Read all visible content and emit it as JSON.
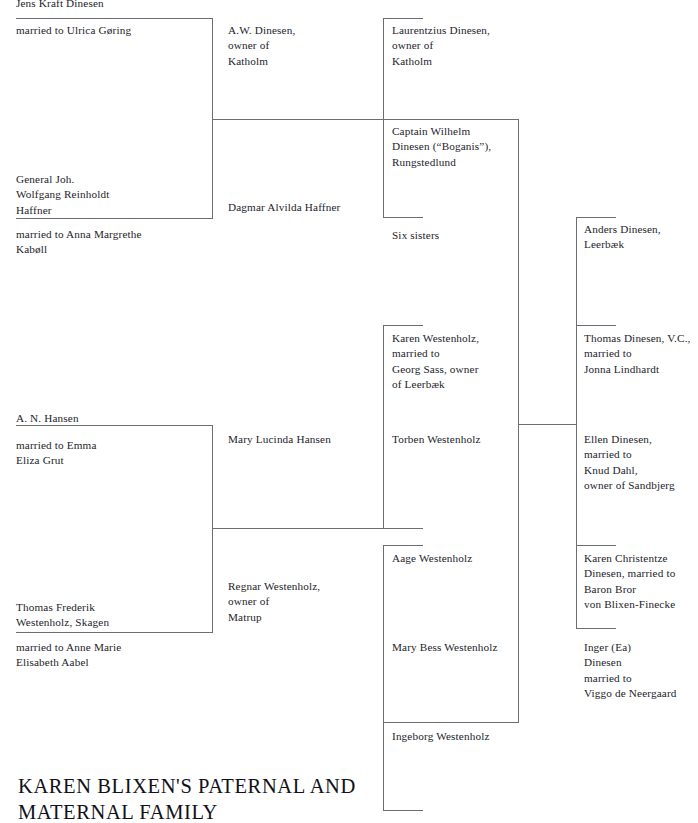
{
  "title": "KAREN BLIXEN'S PATERNAL AND\nMATERNAL FAMILY",
  "colors": {
    "rule": "#6d6d75",
    "text": "#23232b",
    "background": "#ffffff"
  },
  "nodes": [
    {
      "id": "jens-kraft-dinesen",
      "text": "Jens Kraft Dinesen",
      "x": 16,
      "y": -4,
      "w": 200
    },
    {
      "id": "married-ulrica-goring",
      "text": "married to Ulrica Gøring",
      "x": 16,
      "y": 23,
      "w": 200
    },
    {
      "id": "general-haffner",
      "text": "General Joh.\nWolfgang Reinholdt\nHaffner",
      "x": 16,
      "y": 172,
      "w": 200
    },
    {
      "id": "married-anna-margrethe",
      "text": "married to Anna Margrethe\nKabøll",
      "x": 16,
      "y": 227,
      "w": 200
    },
    {
      "id": "a-n-hansen",
      "text": "A. N. Hansen",
      "x": 16,
      "y": 411,
      "w": 200
    },
    {
      "id": "married-emma-eliza-grut",
      "text": "married to Emma\nEliza Grut",
      "x": 16,
      "y": 438,
      "w": 200
    },
    {
      "id": "thomas-frederik-westenholz",
      "text": "Thomas Frederik\nWestenholz, Skagen",
      "x": 16,
      "y": 600,
      "w": 200
    },
    {
      "id": "married-anne-marie-aabel",
      "text": "married to Anne Marie\nElisabeth Aabel",
      "x": 16,
      "y": 640,
      "w": 200
    },
    {
      "id": "aw-dinesen",
      "text": "A.W. Dinesen,\nowner of\nKatholm",
      "x": 228,
      "y": 23,
      "w": 150
    },
    {
      "id": "dagmar-alvilda-haffner",
      "text": "Dagmar Alvilda Haffner",
      "x": 228,
      "y": 200,
      "w": 160
    },
    {
      "id": "mary-lucinda-hansen",
      "text": "Mary Lucinda Hansen",
      "x": 228,
      "y": 432,
      "w": 160
    },
    {
      "id": "regnar-westenholz",
      "text": "Regnar Westenholz,\nowner of\nMatrup",
      "x": 228,
      "y": 579,
      "w": 160
    },
    {
      "id": "laurentzius-dinesen",
      "text": "Laurentzius Dinesen,\nowner of\nKatholm",
      "x": 392,
      "y": 23,
      "w": 140
    },
    {
      "id": "captain-wilhelm-dinesen",
      "text": "Captain Wilhelm\nDinesen (“Boganis”),\nRungstedlund",
      "x": 392,
      "y": 124,
      "w": 150
    },
    {
      "id": "six-sisters",
      "text": "Six sisters",
      "x": 392,
      "y": 228,
      "w": 140
    },
    {
      "id": "karen-westenholz",
      "text": "Karen Westenholz,\nmarried to\nGeorg Sass, owner\nof Leerbæk",
      "x": 392,
      "y": 331,
      "w": 150
    },
    {
      "id": "torben-westenholz",
      "text": "Torben Westenholz",
      "x": 392,
      "y": 432,
      "w": 150
    },
    {
      "id": "aage-westenholz",
      "text": "Aage Westenholz",
      "x": 392,
      "y": 551,
      "w": 150
    },
    {
      "id": "mary-bess-westenholz",
      "text": "Mary Bess Westenholz",
      "x": 392,
      "y": 640,
      "w": 160
    },
    {
      "id": "ingeborg-westenholz",
      "text": "Ingeborg Westenholz",
      "x": 392,
      "y": 729,
      "w": 160
    },
    {
      "id": "anders-dinesen",
      "text": "Anders Dinesen,\nLeerbæk",
      "x": 584,
      "y": 222,
      "w": 115
    },
    {
      "id": "thomas-dinesen-vc",
      "text": "Thomas Dinesen, V.C.,\nmarried to\nJonna Lindhardt",
      "x": 584,
      "y": 331,
      "w": 120
    },
    {
      "id": "ellen-dinesen",
      "text": "Ellen Dinesen,\nmarried to\nKnud Dahl,\nowner of Sandbjerg",
      "x": 584,
      "y": 432,
      "w": 120
    },
    {
      "id": "karen-christentze-dinesen",
      "text": "Karen Christentze\nDinesen, married to\nBaron Bror\nvon Blixen-Finecke",
      "x": 584,
      "y": 551,
      "w": 120
    },
    {
      "id": "inger-ea-dinesen",
      "text": "Inger (Ea)\nDinesen\nmarried to\nViggo de Neergaard",
      "x": 584,
      "y": 640,
      "w": 120
    }
  ],
  "rules": [
    {
      "id": "col1-top-bracket-top",
      "o": "h",
      "x": 16,
      "y": 18,
      "len": 197
    },
    {
      "id": "col1-top-bracket-side",
      "o": "v",
      "x": 212,
      "y": 18,
      "len": 201
    },
    {
      "id": "col1-top-bracket-bottom",
      "o": "h",
      "x": 16,
      "y": 218,
      "len": 197
    },
    {
      "id": "col1-top-connector",
      "o": "h",
      "x": 212,
      "y": 119,
      "len": 172
    },
    {
      "id": "col1-bot-bracket-top",
      "o": "h",
      "x": 16,
      "y": 425,
      "len": 197
    },
    {
      "id": "col1-bot-bracket-side",
      "o": "v",
      "x": 212,
      "y": 425,
      "len": 208
    },
    {
      "id": "col1-bot-bracket-bottom",
      "o": "h",
      "x": 16,
      "y": 632,
      "len": 197
    },
    {
      "id": "col1-bot-connector",
      "o": "h",
      "x": 212,
      "y": 528,
      "len": 172
    },
    {
      "id": "col3-top-bracket-top",
      "o": "h",
      "x": 383,
      "y": 18,
      "len": 40
    },
    {
      "id": "col3-top-bracket-side",
      "o": "v",
      "x": 383,
      "y": 18,
      "len": 200
    },
    {
      "id": "col3-top-bracket-bottom",
      "o": "h",
      "x": 383,
      "y": 217,
      "len": 40
    },
    {
      "id": "col3-wilhelm-bracket-top",
      "o": "h",
      "x": 383,
      "y": 119,
      "len": 135
    },
    {
      "id": "col3-wilhelm-side",
      "o": "v",
      "x": 518,
      "y": 119,
      "len": 305
    },
    {
      "id": "col3-karen-bracket-top",
      "o": "h",
      "x": 383,
      "y": 325,
      "len": 40
    },
    {
      "id": "col3-karen-side",
      "o": "v",
      "x": 383,
      "y": 325,
      "len": 204
    },
    {
      "id": "col3-karen-bracket-bot",
      "o": "h",
      "x": 383,
      "y": 528,
      "len": 40
    },
    {
      "id": "col3-karen-connector",
      "o": "h",
      "x": 212,
      "y": 528,
      "len": 0
    },
    {
      "id": "col3-aage-bracket-top",
      "o": "h",
      "x": 383,
      "y": 545,
      "len": 40
    },
    {
      "id": "col3-aage-side",
      "o": "v",
      "x": 383,
      "y": 545,
      "len": 178
    },
    {
      "id": "col3-aage-bracket-bot",
      "o": "h",
      "x": 383,
      "y": 722,
      "len": 40
    },
    {
      "id": "col3-ingeborg-side",
      "o": "v",
      "x": 383,
      "y": 722,
      "len": 88
    },
    {
      "id": "col3-ingeborg-bot",
      "o": "h",
      "x": 383,
      "y": 810,
      "len": 40
    },
    {
      "id": "col3-lower-side",
      "o": "v",
      "x": 518,
      "y": 424,
      "len": 299
    },
    {
      "id": "col3-lower-bracket-bot",
      "o": "h",
      "x": 383,
      "y": 722,
      "len": 136
    },
    {
      "id": "col5-anders-bracket-top",
      "o": "h",
      "x": 576,
      "y": 217,
      "len": 40
    },
    {
      "id": "col5-anders-side",
      "o": "v",
      "x": 576,
      "y": 217,
      "len": 108
    },
    {
      "id": "col5-thomas-bracket-top",
      "o": "h",
      "x": 576,
      "y": 325,
      "len": 40
    },
    {
      "id": "col5-thomas-side",
      "o": "v",
      "x": 576,
      "y": 325,
      "len": 99
    },
    {
      "id": "col5-mid-connector",
      "o": "h",
      "x": 518,
      "y": 424,
      "len": 58
    },
    {
      "id": "col5-ellen-side",
      "o": "v",
      "x": 576,
      "y": 424,
      "len": 121
    },
    {
      "id": "col5-karenc-bracket-top",
      "o": "h",
      "x": 576,
      "y": 545,
      "len": 40
    },
    {
      "id": "col5-karenc-side",
      "o": "v",
      "x": 576,
      "y": 545,
      "len": 83
    },
    {
      "id": "col5-karenc-bracket-bot",
      "o": "h",
      "x": 576,
      "y": 628,
      "len": 40
    }
  ]
}
